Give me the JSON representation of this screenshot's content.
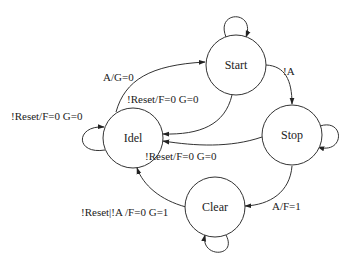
{
  "diagram": {
    "type": "state-machine",
    "states": [
      {
        "id": "start",
        "label": "Start"
      },
      {
        "id": "idel",
        "label": "Idel"
      },
      {
        "id": "stop",
        "label": "Stop"
      },
      {
        "id": "clear",
        "label": "Clear"
      }
    ],
    "transitions": [
      {
        "from": "idel",
        "to": "start",
        "label": "A/G=0"
      },
      {
        "from": "start",
        "to": "idel",
        "label": "!Reset/F=0 G=0"
      },
      {
        "from": "start",
        "to": "stop",
        "label": "!A"
      },
      {
        "from": "stop",
        "to": "idel",
        "label": "!Reset/F=0 G=0"
      },
      {
        "from": "stop",
        "to": "clear",
        "label": "A/F=1"
      },
      {
        "from": "clear",
        "to": "idel",
        "label": "!Reset|!A /F=0 G=1"
      },
      {
        "from": "idel",
        "to": "idel",
        "label": "!Reset/F=0 G=0"
      },
      {
        "from": "start",
        "to": "start",
        "label": ""
      },
      {
        "from": "stop",
        "to": "stop",
        "label": ""
      },
      {
        "from": "clear",
        "to": "clear",
        "label": ""
      }
    ]
  }
}
